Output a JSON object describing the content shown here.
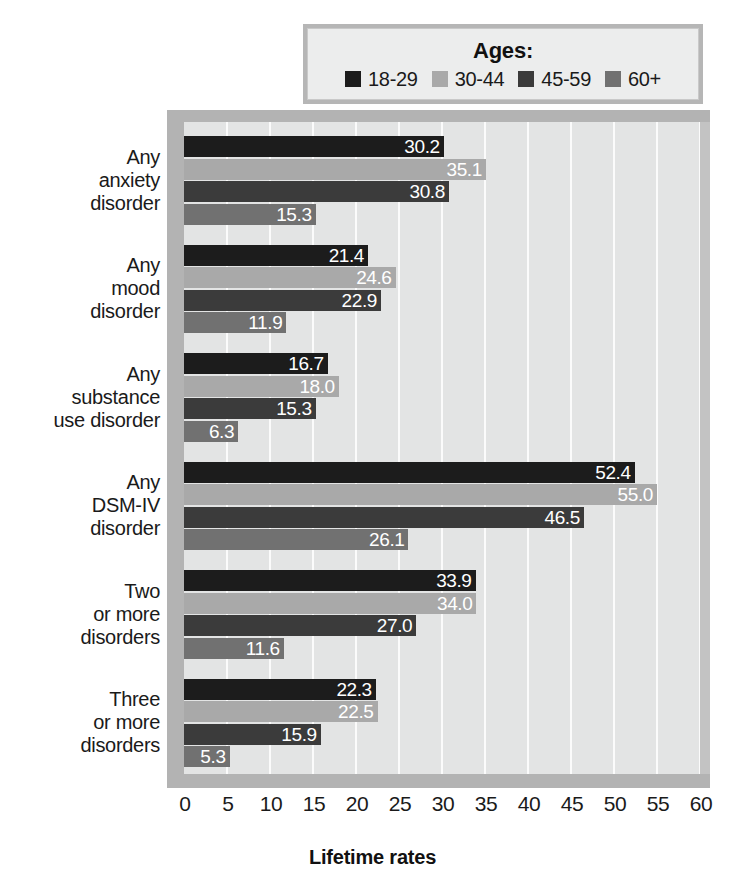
{
  "legend": {
    "title": "Ages:",
    "items": [
      {
        "label": "18-29",
        "color": "#1c1c1c"
      },
      {
        "label": "30-44",
        "color": "#a9a9a9"
      },
      {
        "label": "45-59",
        "color": "#3b3b3b"
      },
      {
        "label": "60+",
        "color": "#717171"
      }
    ]
  },
  "axis": {
    "title": "Lifetime rates",
    "ticks": [
      "0",
      "5",
      "10",
      "15",
      "20",
      "25",
      "30",
      "35",
      "40",
      "45",
      "50",
      "55",
      "60"
    ]
  },
  "categories": [
    {
      "lines": [
        "Any",
        "anxiety",
        "disorder"
      ]
    },
    {
      "lines": [
        "Any",
        "mood",
        "disorder"
      ]
    },
    {
      "lines": [
        "Any",
        "substance",
        "use disorder"
      ]
    },
    {
      "lines": [
        "Any",
        "DSM-IV",
        "disorder"
      ]
    },
    {
      "lines": [
        "Two",
        "or more",
        "disorders"
      ]
    },
    {
      "lines": [
        "Three",
        "or more",
        "disorders"
      ]
    }
  ],
  "chart_data": {
    "type": "bar",
    "orientation": "horizontal",
    "title": "",
    "xlabel": "Lifetime rates",
    "ylabel": "",
    "xlim": [
      0,
      60
    ],
    "xticks": [
      0,
      5,
      10,
      15,
      20,
      25,
      30,
      35,
      40,
      45,
      50,
      55,
      60
    ],
    "grid": "vertical",
    "legend_title": "Ages:",
    "legend_position": "top",
    "categories": [
      "Any anxiety disorder",
      "Any mood disorder",
      "Any substance use disorder",
      "Any DSM-IV disorder",
      "Two or more disorders",
      "Three or more disorders"
    ],
    "series": [
      {
        "name": "18-29",
        "color": "#1c1c1c",
        "values": [
          30.2,
          21.4,
          16.7,
          52.4,
          33.9,
          22.3
        ]
      },
      {
        "name": "30-44",
        "color": "#a9a9a9",
        "values": [
          35.1,
          24.6,
          18.0,
          55.0,
          34.0,
          22.5
        ]
      },
      {
        "name": "45-59",
        "color": "#3b3b3b",
        "values": [
          30.8,
          22.9,
          15.3,
          46.5,
          27.0,
          15.9
        ]
      },
      {
        "name": "60+",
        "color": "#717171",
        "values": [
          15.3,
          11.9,
          6.3,
          26.1,
          11.6,
          5.3
        ]
      }
    ],
    "data_labels": [
      [
        "30.2",
        "35.1",
        "30.8",
        "15.3"
      ],
      [
        "21.4",
        "24.6",
        "22.9",
        "11.9"
      ],
      [
        "16.7",
        "18.0",
        "15.3",
        "6.3"
      ],
      [
        "52.4",
        "55.0",
        "46.5",
        "26.1"
      ],
      [
        "33.9",
        "34.0",
        "27.0",
        "11.6"
      ],
      [
        "22.3",
        "22.5",
        "15.9",
        "5.3"
      ]
    ]
  }
}
